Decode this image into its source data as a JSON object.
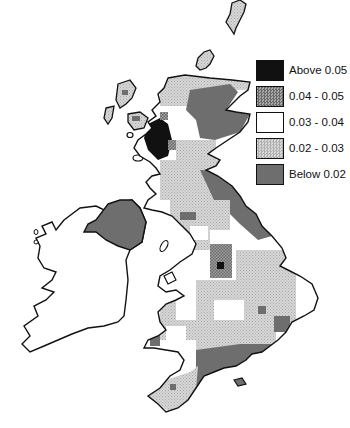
{
  "map": {
    "title": "",
    "region": "British Isles (Great Britain and Ireland)",
    "colors": {
      "above_005": "#111111",
      "c004_005": "#8a8a8a",
      "c003_004": "#ffffff",
      "c002_003": "#c8c8c8",
      "below_002": "#6e6e6e",
      "outline": "#111111"
    }
  },
  "legend": {
    "items": [
      {
        "label": "Above 0.05",
        "color": "#111111",
        "pattern": "solid"
      },
      {
        "label": "0.04 - 0.05",
        "color": "#8a8a8a",
        "pattern": "crosshatch"
      },
      {
        "label": "0.03 - 0.04",
        "color": "#ffffff",
        "pattern": "solid"
      },
      {
        "label": "0.02 - 0.03",
        "color": "#c8c8c8",
        "pattern": "stipple"
      },
      {
        "label": "Below 0.02",
        "color": "#6e6e6e",
        "pattern": "solid"
      }
    ]
  }
}
